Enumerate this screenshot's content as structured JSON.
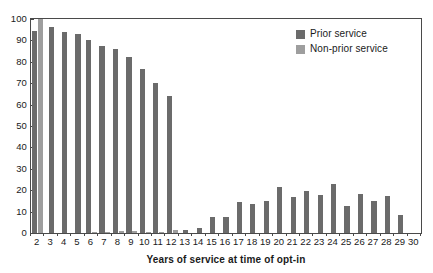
{
  "chart_data": {
    "type": "bar",
    "title": "",
    "xlabel": "Years of service at time of opt-in",
    "ylabel": "",
    "xlim": [
      1.5,
      30.5
    ],
    "ylim": [
      0,
      100
    ],
    "grid": false,
    "legend_position": "top-right",
    "categories": [
      2,
      3,
      4,
      5,
      6,
      7,
      8,
      9,
      10,
      11,
      12,
      13,
      14,
      15,
      16,
      17,
      18,
      19,
      20,
      21,
      22,
      23,
      24,
      25,
      26,
      27,
      28,
      29,
      30
    ],
    "x_tick_labels": [
      "2",
      "3",
      "4",
      "5",
      "6",
      "7",
      "8",
      "9",
      "10",
      "11",
      "12",
      "13",
      "14",
      "15",
      "16",
      "17",
      "18",
      "19",
      "20",
      "21",
      "22",
      "23",
      "24",
      "25",
      "26",
      "27",
      "28",
      "29",
      "30"
    ],
    "y_tick_labels": [
      "0",
      "10",
      "20",
      "30",
      "40",
      "50",
      "60",
      "70",
      "80",
      "90",
      "100"
    ],
    "y_ticks": [
      0,
      10,
      20,
      30,
      40,
      50,
      60,
      70,
      80,
      90,
      100
    ],
    "series": [
      {
        "name": "Prior service",
        "color": "#6b6b6b",
        "values": [
          94.3,
          96.1,
          94.0,
          93.2,
          90.1,
          87.2,
          86.0,
          82.3,
          76.6,
          70.3,
          64.1,
          1.3,
          2.2,
          7.7,
          7.4,
          14.5,
          13.4,
          14.9,
          21.5,
          16.6,
          19.5,
          17.9,
          22.9,
          12.6,
          18.2,
          15.1,
          17.4,
          8.6,
          0
        ]
      },
      {
        "name": "Non-prior service",
        "color": "#9e9e9e",
        "values": [
          100.0,
          0,
          0,
          0,
          0.5,
          0.4,
          0.8,
          0.8,
          0.5,
          0.4,
          1.4,
          0,
          0,
          0,
          0,
          0,
          0,
          0,
          0,
          0,
          0,
          0,
          0,
          0,
          0,
          0,
          0,
          0,
          0
        ]
      }
    ]
  },
  "legend": {
    "items": [
      {
        "label": "Prior service",
        "color": "#6b6b6b"
      },
      {
        "label": "Non-prior service",
        "color": "#9e9e9e"
      }
    ]
  }
}
